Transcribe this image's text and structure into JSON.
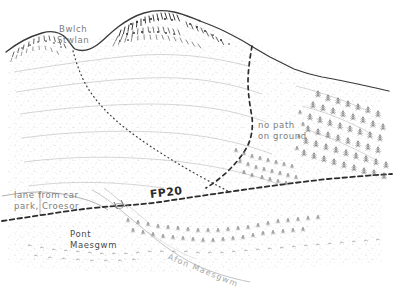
{
  "map": {
    "title": "Bwlch Stwlan hillside sketch map",
    "style": "hand-drawn pen-and-ink topographic sketch",
    "background_color": "#ffffff",
    "ink_color": "#4a4a4a",
    "label_color": "#7d7d7d",
    "route_label_color": "#2b2b2b",
    "labels": {
      "bwlch_stwlan": "Bwlch\nStwlan",
      "no_path_on_ground": "no path\non ground",
      "lane_from_car_park": "lane from car\npark, Croesor",
      "footpath_number": "FP20",
      "pont_maesgwm": "Pont\nMaesgwm",
      "afon_maesgwm": "Afon Maesgwm"
    },
    "features": [
      {
        "name": "skyline-ridge",
        "kind": "ridge-line",
        "description": "solid dark ridge crest running from left edge up over the summit crag and down to the right edge"
      },
      {
        "name": "summit-crag",
        "kind": "crag-hachure",
        "description": "dense rock hachuring along the top of the main summit"
      },
      {
        "name": "left-crag",
        "kind": "crag-hachure",
        "description": "smaller rocky outcrop at the upper left"
      },
      {
        "name": "dotted-path-from-bwlch",
        "kind": "dotted-path",
        "description": "faint dotted path descending south-east from the bwlch"
      },
      {
        "name": "dashed-path-east-ridge",
        "kind": "dashed-path",
        "description": "bold dashed path descending from the right-hand ridge, marked no path on ground"
      },
      {
        "name": "footpath-fp20",
        "kind": "dashed-path",
        "description": "bold dashed right of way FP20 running west-east across the lower slope"
      },
      {
        "name": "lane-to-croesor",
        "kind": "thin-line",
        "description": "thin lane track entering from the left edge"
      },
      {
        "name": "pont-maesgwm-bridge",
        "kind": "bridge",
        "description": "bridge where the footpath crosses Afon Maesgwm"
      },
      {
        "name": "afon-maesgwm",
        "kind": "stream",
        "description": "stream flowing down to the lower right"
      },
      {
        "name": "woodland-right",
        "kind": "tree-symbols",
        "description": "conifer tree symbols covering the right hillside"
      },
      {
        "name": "woodland-valley",
        "kind": "tree-symbols",
        "description": "tree symbols along the valley floor below the footpath"
      },
      {
        "name": "moorland-stipple",
        "kind": "stipple",
        "description": "light stippled shading over the open hillside"
      }
    ]
  }
}
